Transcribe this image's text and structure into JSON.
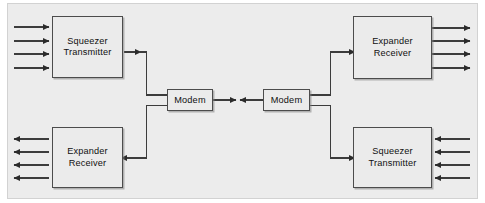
{
  "diagram": {
    "title": "",
    "background_color": "#ececec",
    "block_fill": "#ebebeb",
    "block_stroke": "#4c4c4c",
    "line_color": "#3c3c3c",
    "blocks": [
      {
        "id": "squeezer-transmitter-top-left",
        "line1": "Squeezer",
        "line2": "Transmitter",
        "io_arrows": 4,
        "io_side": "left",
        "io_direction": "in"
      },
      {
        "id": "expander-receiver-top-right",
        "line1": "Expander",
        "line2": "Receiver",
        "io_arrows": 4,
        "io_side": "right",
        "io_direction": "out"
      },
      {
        "id": "expander-receiver-bottom-left",
        "line1": "Expander",
        "line2": "Receiver",
        "io_arrows": 4,
        "io_side": "left",
        "io_direction": "out"
      },
      {
        "id": "squeezer-transmitter-bottom-right",
        "line1": "Squeezer",
        "line2": "Transmitter",
        "io_arrows": 4,
        "io_side": "right",
        "io_direction": "in"
      },
      {
        "id": "modem-left",
        "line1": "Modem",
        "line2": ""
      },
      {
        "id": "modem-right",
        "line1": "Modem",
        "line2": ""
      }
    ],
    "connections": [
      {
        "from": "squeezer-transmitter-top-left",
        "to": "modem-left",
        "arrowheads": 1
      },
      {
        "from": "modem-left",
        "to": "expander-receiver-bottom-left",
        "arrowheads": 1
      },
      {
        "from": "modem-left",
        "to": "modem-right",
        "arrowheads": 2,
        "note": "two arrowheads meeting at midpoint"
      },
      {
        "from": "modem-right",
        "to": "expander-receiver-top-right",
        "arrowheads": 1
      },
      {
        "from": "squeezer-transmitter-bottom-right",
        "to": "modem-right",
        "arrowheads": 1
      }
    ]
  }
}
